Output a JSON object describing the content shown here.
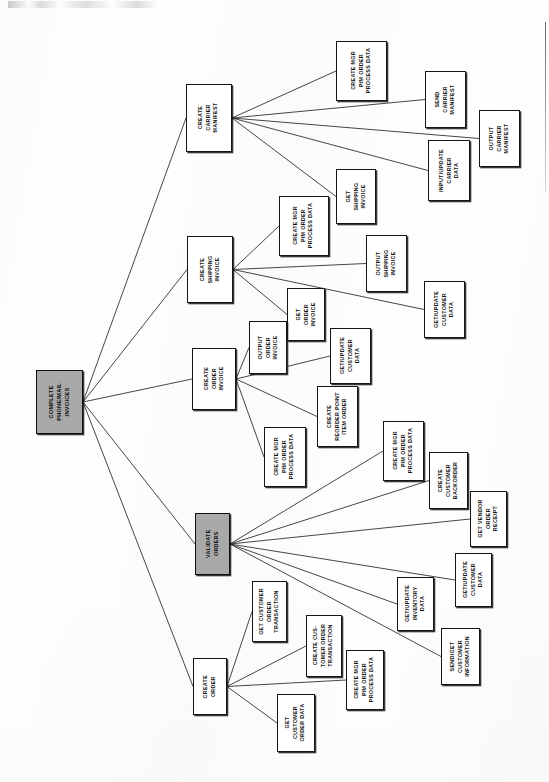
{
  "document": {
    "type": "process-decomposition-diagram",
    "orientation": "landscape-rotated-90",
    "root_label": "COMPLETE PHONE/MAIL INVOICES"
  },
  "chart_data": {
    "type": "diagram",
    "title": "COMPLETE PHONE/MAIL INVOICES",
    "nodes": [
      {
        "id": "root",
        "label": "COMPLETE\nPHONE/MAIL\nINVOICES",
        "shaded": true,
        "x": 36,
        "y": 370,
        "w": 47,
        "h": 64
      },
      {
        "id": "ccm",
        "label": "CREATE\nCARRIER\nMANIFEST",
        "shaded": false,
        "x": 186,
        "y": 84,
        "w": 46,
        "h": 68
      },
      {
        "id": "ccm1",
        "label": "CREATE MGR\nP/M ORDER\nPROCESS DATA",
        "shaded": false,
        "x": 336,
        "y": 41,
        "w": 51,
        "h": 60
      },
      {
        "id": "ccm2",
        "label": "SEND\nCARRIER\nMANIFEST",
        "shaded": false,
        "x": 425,
        "y": 71,
        "w": 41,
        "h": 57
      },
      {
        "id": "ccm3",
        "label": "OUTPUT\nCARRIER\nMANIFEST",
        "shaded": false,
        "x": 479,
        "y": 110,
        "w": 41,
        "h": 57
      },
      {
        "id": "ccm4",
        "label": "INPUT/UPDATE\nCARRIER\nDATA",
        "shaded": false,
        "x": 428,
        "y": 140,
        "w": 42,
        "h": 61
      },
      {
        "id": "ccm5",
        "label": "GET\nSHIPPING\nINVOICE",
        "shaded": false,
        "x": 336,
        "y": 169,
        "w": 40,
        "h": 55
      },
      {
        "id": "csi",
        "label": "CREATE\nSHIPPING\nINVOICE",
        "shaded": false,
        "x": 187,
        "y": 236,
        "w": 46,
        "h": 67
      },
      {
        "id": "csi1",
        "label": "CREATE MGR\nP/M ORDER\nPROCESS DATA",
        "shaded": false,
        "x": 279,
        "y": 196,
        "w": 50,
        "h": 60
      },
      {
        "id": "csi2",
        "label": "OUTPUT\nSHIPPING\nINVOICE",
        "shaded": false,
        "x": 366,
        "y": 235,
        "w": 41,
        "h": 57
      },
      {
        "id": "csi3",
        "label": "GET/UPDATE\nCUSTOMER\nDATA",
        "shaded": false,
        "x": 424,
        "y": 281,
        "w": 41,
        "h": 57
      },
      {
        "id": "csi4",
        "label": "GET\nORDER\nINVOICE",
        "shaded": false,
        "x": 287,
        "y": 288,
        "w": 38,
        "h": 53
      },
      {
        "id": "coi",
        "label": "CREATE\nORDER\nINVOICE",
        "shaded": false,
        "x": 192,
        "y": 348,
        "w": 44,
        "h": 62
      },
      {
        "id": "coi1",
        "label": "OUTPUT\nORDER\nINVOICE",
        "shaded": false,
        "x": 249,
        "y": 321,
        "w": 38,
        "h": 53
      },
      {
        "id": "coi2",
        "label": "GET/UPDATE\nCUSTOMER\nDATA",
        "shaded": false,
        "x": 330,
        "y": 328,
        "w": 41,
        "h": 56
      },
      {
        "id": "coi3",
        "label": "CREATE\nREORDER POINT\nITEM ORDER",
        "shaded": false,
        "x": 317,
        "y": 386,
        "w": 41,
        "h": 61
      },
      {
        "id": "coi4",
        "label": "CREATE MGR\nP/M ORDER\nPROCESS DATA",
        "shaded": false,
        "x": 264,
        "y": 427,
        "w": 42,
        "h": 60
      },
      {
        "id": "vo",
        "label": "VALIDATE\nORDERS",
        "shaded": true,
        "x": 195,
        "y": 513,
        "w": 35,
        "h": 62
      },
      {
        "id": "vo1",
        "label": "CREATE MGR\nP/M ORDER\nPROCESS DATA",
        "shaded": false,
        "x": 383,
        "y": 421,
        "w": 41,
        "h": 60
      },
      {
        "id": "vo2",
        "label": "CREATE\nCUSTOMER\nBACKORDER",
        "shaded": false,
        "x": 429,
        "y": 452,
        "w": 39,
        "h": 57
      },
      {
        "id": "vo3",
        "label": "GET VENDOR\nORDER\nRECEIPT",
        "shaded": false,
        "x": 470,
        "y": 491,
        "w": 37,
        "h": 56
      },
      {
        "id": "vo4",
        "label": "GET/UPDATE\nCUSTOMER\nDATA",
        "shaded": false,
        "x": 455,
        "y": 553,
        "w": 37,
        "h": 54
      },
      {
        "id": "vo5",
        "label": "GET/UPDATE\nINVENTORY\nDATA",
        "shaded": false,
        "x": 397,
        "y": 577,
        "w": 37,
        "h": 54
      },
      {
        "id": "vo6",
        "label": "SEND/GET\nCUSTOMER\nINFORMATION",
        "shaded": false,
        "x": 441,
        "y": 628,
        "w": 39,
        "h": 57
      },
      {
        "id": "co",
        "label": "CREATE\nORDER",
        "shaded": false,
        "x": 193,
        "y": 658,
        "w": 34,
        "h": 57
      },
      {
        "id": "co1",
        "label": "GET CUSTOMER\nORDER\nTRANSACTION",
        "shaded": false,
        "x": 252,
        "y": 581,
        "w": 35,
        "h": 61
      },
      {
        "id": "co2",
        "label": "CREATE CUS-\nTOMER ORDER\nTRANSACTION",
        "shaded": false,
        "x": 306,
        "y": 615,
        "w": 36,
        "h": 62
      },
      {
        "id": "co3",
        "label": "CREATE MGR\nP/M ORDER\nPROCESS DATA",
        "shaded": false,
        "x": 346,
        "y": 650,
        "w": 38,
        "h": 60
      },
      {
        "id": "co4",
        "label": "GET\nCUSTOMER\nORDER DATA",
        "shaded": false,
        "x": 277,
        "y": 694,
        "w": 38,
        "h": 58
      }
    ],
    "edges": [
      {
        "from": "root",
        "to": "ccm"
      },
      {
        "from": "root",
        "to": "csi"
      },
      {
        "from": "root",
        "to": "coi"
      },
      {
        "from": "root",
        "to": "vo"
      },
      {
        "from": "root",
        "to": "co"
      },
      {
        "from": "ccm",
        "to": "ccm1"
      },
      {
        "from": "ccm",
        "to": "ccm2"
      },
      {
        "from": "ccm",
        "to": "ccm3"
      },
      {
        "from": "ccm",
        "to": "ccm4"
      },
      {
        "from": "ccm",
        "to": "ccm5"
      },
      {
        "from": "csi",
        "to": "csi1"
      },
      {
        "from": "csi",
        "to": "csi2"
      },
      {
        "from": "csi",
        "to": "csi3"
      },
      {
        "from": "csi",
        "to": "csi4"
      },
      {
        "from": "coi",
        "to": "coi1"
      },
      {
        "from": "coi",
        "to": "coi2"
      },
      {
        "from": "coi",
        "to": "coi3"
      },
      {
        "from": "coi",
        "to": "coi4"
      },
      {
        "from": "vo",
        "to": "vo1"
      },
      {
        "from": "vo",
        "to": "vo2"
      },
      {
        "from": "vo",
        "to": "vo3"
      },
      {
        "from": "vo",
        "to": "vo4"
      },
      {
        "from": "vo",
        "to": "vo5"
      },
      {
        "from": "vo",
        "to": "vo6"
      },
      {
        "from": "co",
        "to": "co1"
      },
      {
        "from": "co",
        "to": "co2"
      },
      {
        "from": "co",
        "to": "co3"
      },
      {
        "from": "co",
        "to": "co4"
      }
    ],
    "colors": {
      "shaded_fill": "#a9a9a9",
      "node_fill": "#ffffff",
      "node_border": "#151515",
      "edge_stroke": "#262626",
      "page_background": "#ffffff"
    },
    "legend": []
  }
}
